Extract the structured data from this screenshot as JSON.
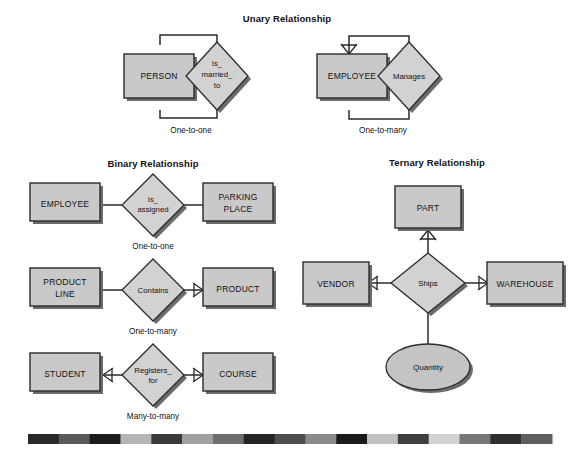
{
  "figure": {
    "sections": [
      {
        "id": "unary",
        "title": "Unary Relationship"
      },
      {
        "id": "binary",
        "title": "Binary Relationship"
      },
      {
        "id": "ternary",
        "title": "Ternary Relationship"
      }
    ]
  },
  "unary": {
    "title": "Unary Relationship",
    "examples": [
      {
        "entity": "PERSON",
        "relationship": [
          "Is_",
          "married_",
          "to"
        ],
        "cardinality": "One-to-one"
      },
      {
        "entity": "EMPLOYEE",
        "relationship": [
          "Manages"
        ],
        "cardinality": "One-to-many"
      }
    ]
  },
  "binary": {
    "title": "Binary Relationship",
    "examples": [
      {
        "left_entity": [
          "EMPLOYEE"
        ],
        "relationship": [
          "Is_",
          "assigned"
        ],
        "right_entity": [
          "PARKING",
          "PLACE"
        ],
        "cardinality": "One-to-one"
      },
      {
        "left_entity": [
          "PRODUCT",
          "LINE"
        ],
        "relationship": [
          "Contains"
        ],
        "right_entity": [
          "PRODUCT"
        ],
        "cardinality": "One-to-many"
      },
      {
        "left_entity": [
          "STUDENT"
        ],
        "relationship": [
          "Registers_",
          "for"
        ],
        "right_entity": [
          "COURSE"
        ],
        "cardinality": "Many-to-many"
      }
    ]
  },
  "ternary": {
    "title": "Ternary Relationship",
    "relationship": "Ships",
    "entities": {
      "top": "PART",
      "left": "VENDOR",
      "right": "WAREHOUSE"
    },
    "attribute": "Quantity"
  },
  "colors": {
    "entity_fill": "#c9c9c9",
    "relationship_fill": "#d2d2d2",
    "attribute_fill": "#c4c4c4",
    "stroke": "#2b2b2b",
    "shadow": "#6b6b6b",
    "background": "#ffffff",
    "text": "#111111"
  },
  "color_strip": {
    "segments": [
      "#2a2a2a",
      "#5a5a5a",
      "#1c1c1c",
      "#b5b5b5",
      "#3a3a3a",
      "#a0a0a0",
      "#6e6e6e",
      "#242424",
      "#4e4e4e",
      "#8a8a8a",
      "#1a1a1a",
      "#c0c0c0",
      "#3f3f3f",
      "#d2d2d2",
      "#777777",
      "#2e2e2e",
      "#5f5f5f"
    ]
  }
}
